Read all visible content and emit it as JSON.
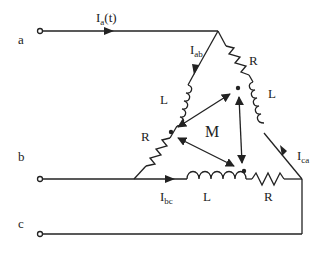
{
  "diagram": {
    "type": "three-phase delta load with mutual inductance",
    "terminals": [
      {
        "id": "a",
        "label": "a"
      },
      {
        "id": "b",
        "label": "b"
      },
      {
        "id": "c",
        "label": "c"
      }
    ],
    "currents": {
      "line_a": {
        "main": "I",
        "sub": "a",
        "suffix": "(t)"
      },
      "ab": {
        "main": "I",
        "sub": "ab"
      },
      "bc": {
        "main": "I",
        "sub": "bc"
      },
      "ca": {
        "main": "I",
        "sub": "ca"
      }
    },
    "components": {
      "ab_inductor": "L",
      "ab_resistor": "R",
      "ca_resistor": "R",
      "ca_inductor": "L",
      "bc_inductor": "L",
      "bc_resistor": "R"
    },
    "mutual": {
      "label": "M"
    },
    "colors": {
      "line": "#222222",
      "background": "#ffffff"
    }
  }
}
